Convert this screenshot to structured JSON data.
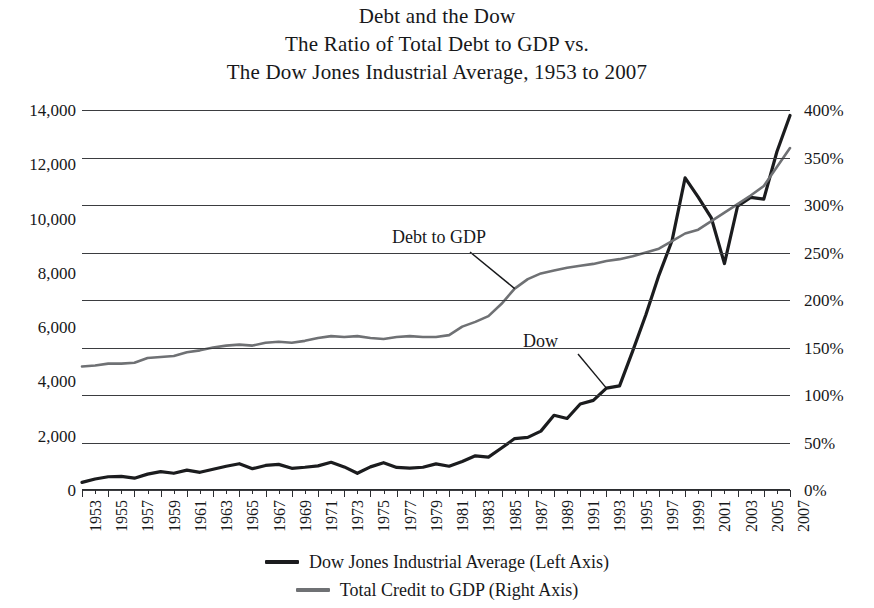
{
  "chart_data": {
    "type": "line",
    "title": "Debt and the Dow",
    "title_lines": [
      "Debt and the Dow",
      "The Ratio of Total Debt to GDP vs.",
      "The Dow Jones Industrial Average, 1953 to 2007"
    ],
    "xlabel": "",
    "ylabel": "",
    "grid": true,
    "legend_position": "bottom",
    "x": [
      1953,
      1954,
      1955,
      1956,
      1957,
      1958,
      1959,
      1960,
      1961,
      1962,
      1963,
      1964,
      1965,
      1966,
      1967,
      1968,
      1969,
      1970,
      1971,
      1972,
      1973,
      1974,
      1975,
      1976,
      1977,
      1978,
      1979,
      1980,
      1981,
      1982,
      1983,
      1984,
      1985,
      1986,
      1987,
      1988,
      1989,
      1990,
      1991,
      1992,
      1993,
      1994,
      1995,
      1996,
      1997,
      1998,
      1999,
      2000,
      2001,
      2002,
      2003,
      2004,
      2005,
      2006,
      2007
    ],
    "xtick_labels": [
      "1953",
      "1955",
      "1957",
      "1959",
      "1961",
      "1963",
      "1965",
      "1967",
      "1969",
      "1971",
      "1973",
      "1975",
      "1977",
      "1979",
      "1981",
      "1983",
      "1985",
      "1987",
      "1989",
      "1991",
      "1993",
      "1995",
      "1997",
      "1999",
      "2001",
      "2003",
      "2005",
      "2007"
    ],
    "xlim": [
      1953,
      2007
    ],
    "left_axis": {
      "name": "Dow Jones Industrial Average",
      "unit": "index points",
      "ylim": [
        0,
        14000
      ],
      "ticks": [
        0,
        2000,
        4000,
        6000,
        8000,
        10000,
        12000,
        14000
      ],
      "tick_labels": [
        "0",
        "2,000",
        "4,000",
        "6,000",
        "8,000",
        "10,000",
        "12,000",
        "14,000"
      ]
    },
    "right_axis": {
      "name": "Total Credit to GDP",
      "unit": "percent of GDP",
      "ylim": [
        0,
        400
      ],
      "ticks": [
        0,
        50,
        100,
        150,
        200,
        250,
        300,
        350,
        400
      ],
      "tick_labels": [
        "0%",
        "50%",
        "100%",
        "150%",
        "200%",
        "250%",
        "300%",
        "350%",
        "400%"
      ]
    },
    "series": [
      {
        "name": "Dow Jones Industrial Average (Left Axis)",
        "axis": "left",
        "color": "#1b1c1e",
        "values": [
          280,
          404,
          488,
          499,
          436,
          584,
          679,
          616,
          731,
          652,
          763,
          874,
          969,
          786,
          905,
          944,
          800,
          839,
          890,
          1020,
          851,
          616,
          852,
          1005,
          831,
          805,
          839,
          964,
          875,
          1047,
          1259,
          1212,
          1547,
          1896,
          1939,
          2169,
          2753,
          2634,
          3169,
          3301,
          3754,
          3834,
          5117,
          6448,
          7908,
          9181,
          11497,
          10787,
          10022,
          8342,
          10454,
          10783,
          10718,
          12463,
          13800
        ],
        "annotation": "Dow"
      },
      {
        "name": "Total Credit to GDP (Right Axis)",
        "axis": "right",
        "color": "#6f7174",
        "values": [
          130,
          131,
          133,
          133,
          134,
          139,
          140,
          141,
          145,
          147,
          150,
          152,
          153,
          152,
          155,
          156,
          155,
          157,
          160,
          162,
          161,
          162,
          160,
          159,
          161,
          162,
          161,
          161,
          163,
          172,
          177,
          183,
          196,
          212,
          222,
          228,
          231,
          234,
          236,
          238,
          241,
          243,
          246,
          250,
          254,
          262,
          270,
          274,
          283,
          292,
          301,
          310,
          320,
          340,
          360
        ],
        "annotation": "Debt to GDP"
      }
    ],
    "annotations": [
      {
        "text": "Debt to GDP",
        "target_series": "Total Credit to GDP (Right Axis)",
        "target_year": 1986,
        "target_value": 212
      },
      {
        "text": "Dow",
        "target_series": "Dow Jones Industrial Average (Left Axis)",
        "target_year": 1993,
        "target_value": 3754
      }
    ]
  },
  "legend": {
    "entries": [
      {
        "label": "Dow Jones Industrial Average (Left Axis)",
        "color": "#1b1c1e"
      },
      {
        "label": "Total Credit to GDP (Right Axis)",
        "color": "#6f7174"
      }
    ]
  }
}
